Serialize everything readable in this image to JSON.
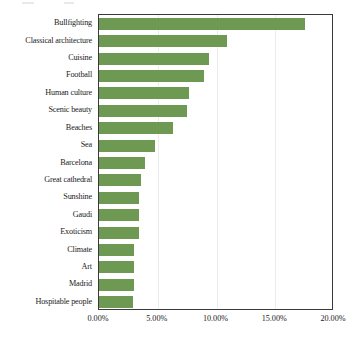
{
  "chart_data": {
    "type": "bar",
    "orientation": "horizontal",
    "title": "",
    "subtitle": "",
    "xlabel": "",
    "ylabel": "",
    "xlim": [
      0,
      20
    ],
    "ylim": null,
    "grid": true,
    "legend": null,
    "legend_position": "none",
    "bar_color": "#6d9953",
    "axis_color": "#3a3a3a",
    "gridline_color": "#ececec",
    "value_format": "percent-2dp",
    "categories": [
      "Bullfighting",
      "Classical architecture",
      "Cuisine",
      "Football",
      "Human culture",
      "Scenic beauty",
      "Beaches",
      "Sea",
      "Barcelona",
      "Great cathedral",
      "Sunshine",
      "Gaudi",
      "Exoticism",
      "Climate",
      "Art",
      "Madrid",
      "Hospitable people"
    ],
    "values": [
      17.5,
      10.9,
      9.4,
      8.9,
      7.7,
      7.5,
      6.3,
      4.8,
      3.9,
      3.6,
      3.4,
      3.4,
      3.4,
      3.0,
      3.0,
      3.0,
      2.9
    ],
    "xticks": [
      0,
      5,
      10,
      15,
      20
    ],
    "xtick_labels": [
      "0.00%",
      "5.00%",
      "10.00%",
      "15.00%",
      "20.00%"
    ]
  }
}
